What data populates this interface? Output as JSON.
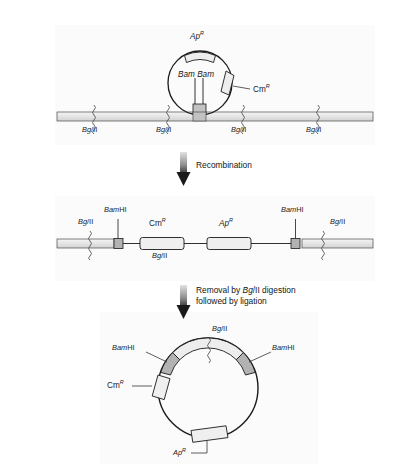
{
  "figure": {
    "panel_bg": "#fbfbfb"
  },
  "panel1": {
    "name": "plasmid-integration-into-chromosome",
    "plasmid": {
      "ap_label": "Ap",
      "ap_sup": "R",
      "cm_label": "Cm",
      "cm_sup": "R",
      "bam_label_left": "Bam",
      "bam_label_right": "Bam"
    },
    "chromosome": {
      "sites": [
        {
          "label_italic": "Bg",
          "label_plain": "/II",
          "x": 94
        },
        {
          "label_italic": "Bg",
          "label_plain": "/II",
          "x": 168
        },
        {
          "label_italic": "Bg",
          "label_plain": "/II",
          "x": 243
        },
        {
          "label_italic": "Bg",
          "label_plain": "/II",
          "x": 318
        }
      ]
    }
  },
  "arrow1": {
    "label": "Recombination"
  },
  "panel2": {
    "name": "recombinant-chromosome-linear-map",
    "labels": {
      "bg_left_italic": "Bg",
      "bg_left_plain": "/II",
      "bamhi_left_italic": "Bam",
      "bamhi_left_plain": "HI",
      "cm_label": "Cm",
      "cm_sup": "R",
      "bg_mid_italic": "Bg",
      "bg_mid_plain": "/II",
      "ap_label": "Ap",
      "ap_sup": "R",
      "bamhi_right_italic": "Bam",
      "bamhi_right_plain": "HI",
      "bg_right_italic": "Bg",
      "bg_right_plain": "/II"
    }
  },
  "arrow2": {
    "line1_pre": "Removal by ",
    "line1_italic": "Bg",
    "line1_post": "/II digestion",
    "line2": "followed by ligation"
  },
  "panel3": {
    "name": "recircularized-plasmid",
    "labels": {
      "bg_top_italic": "Bg",
      "bg_top_plain": "/II",
      "bamhi_left_italic": "Bam",
      "bamhi_left_plain": "HI",
      "bamhi_right_italic": "Bam",
      "bamhi_right_plain": "HI",
      "cm_label": "Cm",
      "cm_sup": "R",
      "ap_label": "Ap",
      "ap_sup": "R"
    }
  },
  "colors": {
    "stroke": "#1a1a1a",
    "cassette_fill": "#eeeeee",
    "band_fill": "#ededed",
    "dark_box": "#b8b8b8",
    "arrow_top": "#d8d8d8",
    "arrow_bottom": "#1a1a1a"
  }
}
